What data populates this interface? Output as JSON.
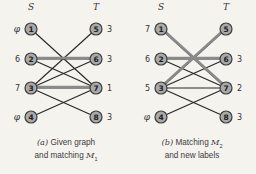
{
  "colors": {
    "background": "#f5f3ee",
    "node_fill": "#a9a9a9",
    "node_stroke": "#3d3d3d",
    "edge": "#262626",
    "edge_matching": "#8a8a8a",
    "text": "#333333"
  },
  "graphs": [
    {
      "id": "a",
      "left_header": "S",
      "right_header": "T",
      "left_nodes": [
        {
          "id": "1",
          "label": "φ"
        },
        {
          "id": "2",
          "label": "6"
        },
        {
          "id": "3",
          "label": "7"
        },
        {
          "id": "4",
          "label": "φ"
        }
      ],
      "right_nodes": [
        {
          "id": "5",
          "label": "3"
        },
        {
          "id": "6",
          "label": "3"
        },
        {
          "id": "7",
          "label": "1"
        },
        {
          "id": "8",
          "label": "3"
        }
      ],
      "edges": [
        {
          "from": "1",
          "to": "7",
          "matching": false
        },
        {
          "from": "2",
          "to": "6",
          "matching": true
        },
        {
          "from": "2",
          "to": "7",
          "matching": false
        },
        {
          "from": "3",
          "to": "5",
          "matching": false
        },
        {
          "from": "3",
          "to": "6",
          "matching": false
        },
        {
          "from": "3",
          "to": "7",
          "matching": true
        },
        {
          "from": "3",
          "to": "8",
          "matching": false
        },
        {
          "from": "4",
          "to": "7",
          "matching": false
        }
      ],
      "caption": {
        "prefix": "(a)",
        "line1_text": "Given graph",
        "line1_var": "",
        "line1_sub": "",
        "line2_text": "and matching",
        "line2_var": "M",
        "line2_sub": "1"
      }
    },
    {
      "id": "b",
      "left_header": "S",
      "right_header": "T",
      "left_nodes": [
        {
          "id": "1",
          "label": "7"
        },
        {
          "id": "2",
          "label": "6"
        },
        {
          "id": "3",
          "label": "5"
        },
        {
          "id": "4",
          "label": "φ"
        }
      ],
      "right_nodes": [
        {
          "id": "5",
          "label": ""
        },
        {
          "id": "6",
          "label": "3"
        },
        {
          "id": "7",
          "label": "2"
        },
        {
          "id": "8",
          "label": "3"
        }
      ],
      "edges": [
        {
          "from": "1",
          "to": "7",
          "matching": true
        },
        {
          "from": "2",
          "to": "6",
          "matching": true
        },
        {
          "from": "2",
          "to": "7",
          "matching": false
        },
        {
          "from": "3",
          "to": "5",
          "matching": true
        },
        {
          "from": "3",
          "to": "6",
          "matching": false
        },
        {
          "from": "3",
          "to": "7",
          "matching": false
        },
        {
          "from": "3",
          "to": "8",
          "matching": false
        },
        {
          "from": "4",
          "to": "7",
          "matching": false
        }
      ],
      "caption": {
        "prefix": "(b)",
        "line1_text": "Matching",
        "line1_var": "M",
        "line1_sub": "2",
        "line2_text": "and new labels",
        "line2_var": "",
        "line2_sub": ""
      }
    }
  ]
}
